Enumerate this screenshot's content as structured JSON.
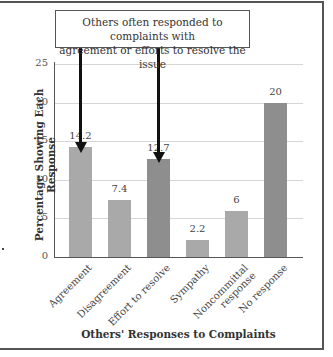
{
  "callout": {
    "line1": "Others often responded to complaints with",
    "line2": "agreement or efforts to resolve the issue"
  },
  "chart_data": {
    "type": "bar",
    "title": "",
    "xlabel": "Others' Responses to Complaints",
    "ylabel": "Percentage Showing Each Response",
    "ylim": [
      0,
      25
    ],
    "yticks": [
      0,
      5,
      10,
      15,
      20,
      25
    ],
    "grid": true,
    "categories": [
      "Agreement",
      "Disagreement",
      "Effort to resolve",
      "Sympathy",
      "Noncommittal response",
      "No response"
    ],
    "values": [
      14.2,
      7.4,
      12.7,
      2.2,
      6,
      20
    ],
    "data_labels": [
      "14.2",
      "7.4",
      "12.7",
      "2.2",
      "6",
      "20"
    ],
    "bar_colors": [
      "#a9a9a9",
      "#a9a9a9",
      "#8e8e8e",
      "#a9a9a9",
      "#a9a9a9",
      "#8e8e8e"
    ],
    "annotations": [
      {
        "text": "Others often responded to complaints with agreement or efforts to resolve the issue",
        "arrows_to": [
          "Agreement",
          "Effort to resolve"
        ]
      }
    ],
    "legend": null
  },
  "axis": {
    "xlabel": "Others' Responses to Complaints",
    "ylabel": "Percentage Showing Each Response",
    "yticks": [
      "0",
      "5",
      "10",
      "15",
      "20",
      "25"
    ]
  },
  "categories": [
    {
      "line1": "Agreement",
      "line2": ""
    },
    {
      "line1": "Disagreement",
      "line2": ""
    },
    {
      "line1": "Effort to resolve",
      "line2": ""
    },
    {
      "line1": "Sympathy",
      "line2": ""
    },
    {
      "line1": "Noncommittal",
      "line2": "response"
    },
    {
      "line1": "No response",
      "line2": ""
    }
  ],
  "labels": [
    "14.2",
    "7.4",
    "12.7",
    "2.2",
    "6",
    "20"
  ]
}
